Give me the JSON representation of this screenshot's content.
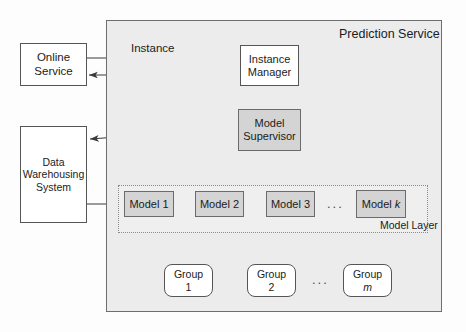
{
  "diagram": {
    "type": "architecture-block-diagram"
  },
  "containers": {
    "prediction_service": {
      "label": "Prediction Service"
    },
    "model_layer": {
      "label": "Model Layer"
    }
  },
  "nodes": {
    "online_service": {
      "line1": "Online",
      "line2": "Service"
    },
    "data_warehousing": {
      "line1": "Data",
      "line2": "Warehousing",
      "line3": "System"
    },
    "instance_manager": {
      "line1": "Instance",
      "line2": "Manager"
    },
    "model_supervisor": {
      "line1": "Model",
      "line2": "Supervisor"
    },
    "model_1": {
      "label": "Model 1"
    },
    "model_2": {
      "label": "Model 2"
    },
    "model_3": {
      "label": "Model 3"
    },
    "model_k_prefix": {
      "label": "Model "
    },
    "model_k_suffix": {
      "label": "k"
    },
    "group_1": {
      "line1": "Group",
      "line2": "1"
    },
    "group_2": {
      "line1": "Group",
      "line2": "2"
    },
    "group_m": {
      "line1": "Group",
      "line2": "m"
    }
  },
  "edge_labels": {
    "instance": "Instance"
  },
  "ellipses": {
    "models": "...",
    "groups": "..."
  },
  "colors": {
    "shaded_node_fill": "#d4d4d4",
    "plain_node_fill": "#ffffff",
    "container_fill": "#ececec",
    "model_layer_fill": "#efefef",
    "stroke": "#555555",
    "text": "#1b1b1b"
  }
}
